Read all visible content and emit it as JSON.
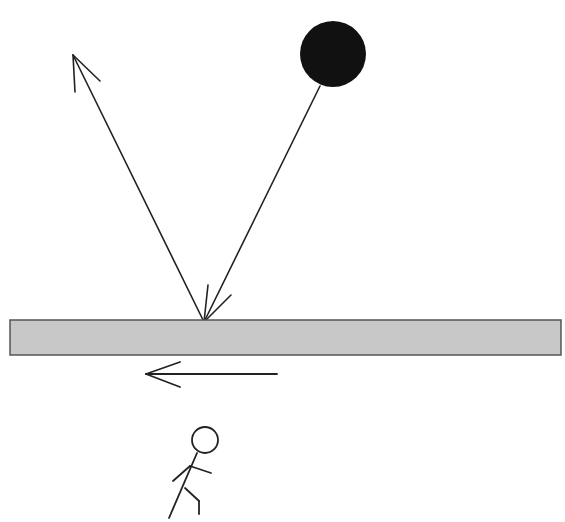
{
  "diagram": {
    "colors": {
      "background": "#ffffff",
      "ball": "#111111",
      "surface_fill": "#c8c8c8",
      "surface_stroke": "#555555",
      "line": "#222222"
    },
    "ball": {
      "cx": 333,
      "cy": 54,
      "r": 33
    },
    "surface": {
      "x": 10,
      "y": 320,
      "width": 551,
      "height": 35
    },
    "impact_point": {
      "x": 204,
      "y": 322
    },
    "incident_path": {
      "from": [
        320,
        86
      ],
      "to": [
        204,
        322
      ]
    },
    "reflected_path": {
      "from": [
        204,
        322
      ],
      "to": [
        73,
        55
      ]
    },
    "motion_arrow": {
      "from": [
        277,
        374
      ],
      "to": [
        146,
        374
      ],
      "direction": "left"
    },
    "stick_figure": {
      "head": {
        "cx": 205,
        "cy": 440,
        "r": 13
      }
    }
  }
}
